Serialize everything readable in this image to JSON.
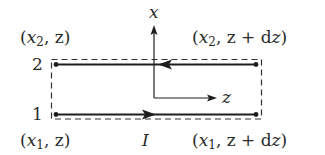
{
  "diagram": {
    "type": "current-loop-element",
    "colors": {
      "line": "#1e1e1e",
      "dash": "#333333",
      "text": "#2a2a2a",
      "background": "#ffffff"
    },
    "axes": {
      "vertical_label": "x",
      "horizontal_label": "z"
    },
    "wires": [
      {
        "id": "2",
        "label": "2",
        "direction": "left"
      },
      {
        "id": "1",
        "label": "1",
        "direction": "right"
      }
    ],
    "corners": {
      "top_left": {
        "open": "(",
        "var": "x",
        "sub": "2",
        "rest": ", z",
        "close": ")"
      },
      "top_right": {
        "open": "(",
        "var": "x",
        "sub": "2",
        "rest": ", z + d",
        "tail": "z",
        "close": ")"
      },
      "bottom_left": {
        "open": "(",
        "var": "x",
        "sub": "1",
        "rest": ", z",
        "close": ")"
      },
      "bottom_right": {
        "open": "(",
        "var": "x",
        "sub": "1",
        "rest": ", z + d",
        "tail": "z",
        "close": ")"
      }
    },
    "current_label": "I",
    "boundary": "dashed rectangle"
  }
}
